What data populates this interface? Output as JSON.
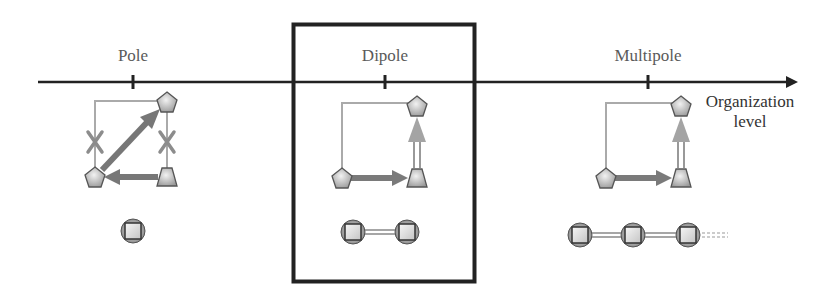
{
  "diagram": {
    "axis": {
      "label_line1": "Organization",
      "label_line2": "level",
      "color": "#222222"
    },
    "stages": [
      {
        "id": "pole",
        "label": "Pole",
        "highlighted": false,
        "chain_units": 1
      },
      {
        "id": "dipole",
        "label": "Dipole",
        "highlighted": true,
        "chain_units": 2
      },
      {
        "id": "multipole",
        "label": "Multipole",
        "highlighted": false,
        "chain_units": 3,
        "chain_continues": true
      }
    ],
    "colors": {
      "thin_line": "#a8a8a8",
      "thick_arrow": "#7a7a7a",
      "light_arrow": "#a0a0a0",
      "cross": "#8a8a8a",
      "node_fill": "#cfcfcf",
      "node_stroke": "#555555",
      "highlight_box": "#222222"
    }
  }
}
